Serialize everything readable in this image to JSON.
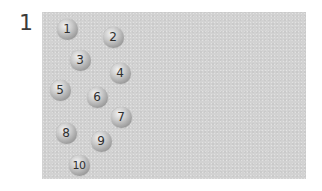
{
  "figure": {
    "label": "1",
    "panel_color": "#d2d2d2"
  },
  "balls": [
    {
      "number": "1",
      "x": 67,
      "y": 29
    },
    {
      "number": "2",
      "x": 113,
      "y": 37
    },
    {
      "number": "3",
      "x": 80,
      "y": 60
    },
    {
      "number": "4",
      "x": 120,
      "y": 73
    },
    {
      "number": "5",
      "x": 60,
      "y": 90
    },
    {
      "number": "6",
      "x": 97,
      "y": 97
    },
    {
      "number": "7",
      "x": 121,
      "y": 117
    },
    {
      "number": "8",
      "x": 66,
      "y": 133
    },
    {
      "number": "9",
      "x": 101,
      "y": 141
    },
    {
      "number": "10",
      "x": 79,
      "y": 165
    }
  ]
}
